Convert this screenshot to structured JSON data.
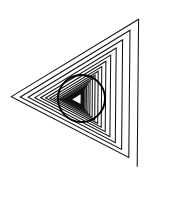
{
  "figure": {
    "background_color": "#ffffff",
    "width": 181,
    "height": 207,
    "caption": ""
  },
  "chart_data": {
    "type": "line",
    "subtitle": "",
    "xlabel": "",
    "ylabel": "",
    "xlim": [
      0,
      181
    ],
    "ylim": [
      0,
      207
    ],
    "grid": false,
    "legend": null,
    "annotations": [],
    "stroke_color": "#111111",
    "stroke_width": 1.05,
    "background_color": "#ffffff",
    "spiral": {
      "name": "triangular-spiral",
      "turns": 13,
      "points_per_turn": 3,
      "inner_vertex": [
        63,
        98
      ],
      "growth_ratio": 1.162,
      "vertex_angles_deg": [
        180,
        300,
        60
      ],
      "start_radius": 6.5,
      "center": [
        78,
        99
      ],
      "rotation_deg": 2,
      "stroke_color": "#111111",
      "stroke_width": 1.05,
      "vertices": [
        [
          71.5,
          99.2
        ],
        [
          81.2,
          93.3
        ],
        [
          81.0,
          104.8
        ],
        [
          70.7,
          99.2
        ],
        [
          81.9,
          92.3
        ],
        [
          81.7,
          105.6
        ],
        [
          69.8,
          99.1
        ],
        [
          82.8,
          91.2
        ],
        [
          82.6,
          106.6
        ],
        [
          68.7,
          99.1
        ],
        [
          83.8,
          89.8
        ],
        [
          83.6,
          107.7
        ],
        [
          67.4,
          99.0
        ],
        [
          85.1,
          88.2
        ],
        [
          84.8,
          109.1
        ],
        [
          65.9,
          99.0
        ],
        [
          86.5,
          86.3
        ],
        [
          86.2,
          110.7
        ],
        [
          64.2,
          98.9
        ],
        [
          88.2,
          84.2
        ],
        [
          87.9,
          112.5
        ],
        [
          62.1,
          98.8
        ],
        [
          90.1,
          81.6
        ],
        [
          89.8,
          114.7
        ],
        [
          59.7,
          98.7
        ],
        [
          92.4,
          78.7
        ],
        [
          92.1,
          117.1
        ],
        [
          56.9,
          98.5
        ],
        [
          95.1,
          75.2
        ],
        [
          94.7,
          120.0
        ],
        [
          53.7,
          98.4
        ],
        [
          98.2,
          71.3
        ],
        [
          97.7,
          123.3
        ],
        [
          49.9,
          98.2
        ],
        [
          101.8,
          66.6
        ],
        [
          101.2,
          127.2
        ],
        [
          45.6,
          98.0
        ],
        [
          105.9,
          61.3
        ],
        [
          105.2,
          131.6
        ],
        [
          40.6,
          97.8
        ],
        [
          110.7,
          55.1
        ],
        [
          109.9,
          136.7
        ],
        [
          34.8,
          97.6
        ],
        [
          116.2,
          48.0
        ],
        [
          115.3,
          142.7
        ],
        [
          28.1,
          97.3
        ],
        [
          122.6,
          39.8
        ],
        [
          121.6,
          149.5
        ],
        [
          20.3,
          97.0
        ],
        [
          130.0,
          30.3
        ],
        [
          128.8,
          157.5
        ],
        [
          11.3,
          96.6
        ],
        [
          138.6,
          19.3
        ],
        [
          137.2,
          166.7
        ]
      ]
    },
    "circle": {
      "name": "overlay-circle",
      "center_x": 81.5,
      "center_y": 98.5,
      "radius": 23.5,
      "stroke_color": "#000000",
      "stroke_width": 1.9,
      "fill": "none"
    }
  }
}
